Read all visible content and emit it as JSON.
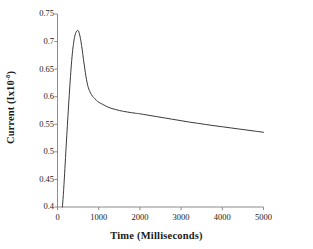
{
  "chart_data": {
    "type": "line",
    "title": "",
    "xlabel": "Time (Milliseconds)",
    "ylabel_text": "Current (Ix10",
    "ylabel_exponent": "-8",
    "ylabel_tail": ")",
    "ylabel_full": "Current (Ix10-8)",
    "xlim": [
      0,
      5000
    ],
    "ylim": [
      0.4,
      0.75
    ],
    "xticks": [
      0,
      1000,
      2000,
      3000,
      4000,
      5000
    ],
    "xtick_labels": [
      "0",
      "1000",
      "2000",
      "3000",
      "4000",
      "5000"
    ],
    "yticks": [
      0.4,
      0.45,
      0.5,
      0.55,
      0.6,
      0.65,
      0.7,
      0.75
    ],
    "ytick_labels": [
      "0.4",
      "0.45",
      "0.5",
      "0.55",
      "0.6",
      "0.65",
      "0.7",
      "0.75"
    ],
    "grid": false,
    "legend": false,
    "legend_position": "none",
    "line_color": "#3a3a3a",
    "line_width": 1.0,
    "axis_color": "#808080",
    "background": "#ffffff",
    "series": [
      {
        "name": "current",
        "x": [
          120,
          150,
          180,
          210,
          240,
          270,
          300,
          330,
          360,
          390,
          420,
          450,
          480,
          500,
          520,
          545,
          570,
          600,
          630,
          660,
          690,
          720,
          750,
          800,
          850,
          900,
          950,
          1000,
          1100,
          1200,
          1300,
          1400,
          1500,
          1600,
          1700,
          1800,
          1900,
          2000,
          2200,
          2400,
          2600,
          2800,
          3000,
          3200,
          3400,
          3600,
          3800,
          4000,
          4200,
          4400,
          4600,
          4800,
          5000
        ],
        "y": [
          0.4,
          0.432,
          0.47,
          0.51,
          0.548,
          0.585,
          0.62,
          0.652,
          0.678,
          0.697,
          0.71,
          0.717,
          0.72,
          0.72,
          0.717,
          0.71,
          0.7,
          0.685,
          0.668,
          0.652,
          0.637,
          0.625,
          0.616,
          0.607,
          0.601,
          0.597,
          0.593,
          0.59,
          0.586,
          0.582,
          0.579,
          0.577,
          0.575,
          0.5735,
          0.5722,
          0.571,
          0.57,
          0.569,
          0.5665,
          0.564,
          0.5615,
          0.559,
          0.5565,
          0.554,
          0.5518,
          0.5496,
          0.5475,
          0.5455,
          0.5435,
          0.5415,
          0.5395,
          0.5375,
          0.5355
        ],
        "peak_x": 490,
        "peak_y": 0.72,
        "end_x": 5000,
        "end_y": 0.5355,
        "start_x": 120,
        "start_y": 0.4
      }
    ]
  },
  "axes": {
    "y_axis_name": "current-axis",
    "x_axis_name": "time-axis"
  }
}
